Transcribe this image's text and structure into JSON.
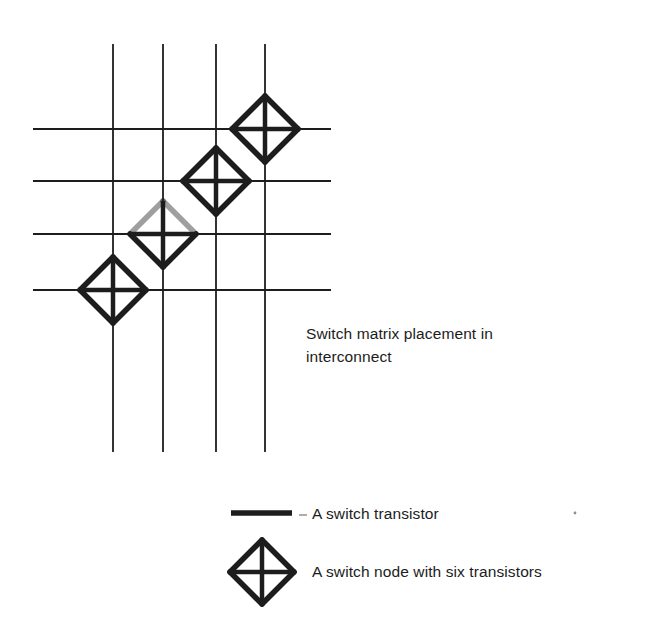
{
  "figure": {
    "kind": "schematic-diagram",
    "background_color": "#ffffff",
    "ink_color": "#1d1d1d",
    "grid": {
      "name": "interconnect-routing-grid",
      "vertical_lines": [
        {
          "x": 113,
          "y1": 44,
          "y2": 452
        },
        {
          "x": 163,
          "y1": 44,
          "y2": 452
        },
        {
          "x": 216,
          "y1": 44,
          "y2": 452
        },
        {
          "x": 265,
          "y1": 44,
          "y2": 452
        }
      ],
      "horizontal_lines": [
        {
          "y": 129,
          "x1": 33,
          "x2": 331
        },
        {
          "y": 181,
          "x1": 33,
          "x2": 331
        },
        {
          "y": 234,
          "x1": 33,
          "x2": 331
        },
        {
          "y": 290,
          "x1": 33,
          "x2": 331
        }
      ],
      "line_width": 1.8
    },
    "switch_nodes": [
      {
        "id": "switch-node-1",
        "cx": 265,
        "cy": 129,
        "r": 33,
        "faded_top": false
      },
      {
        "id": "switch-node-2",
        "cx": 216,
        "cy": 181,
        "r": 33,
        "faded_top": false
      },
      {
        "id": "switch-node-3",
        "cx": 163,
        "cy": 234,
        "r": 33,
        "faded_top": true
      },
      {
        "id": "switch-node-4",
        "cx": 113,
        "cy": 290,
        "r": 33,
        "faded_top": false
      }
    ],
    "node_stroke_width": 5.5,
    "node_cross_width": 4.5
  },
  "caption": {
    "line1": "Switch matrix placement in",
    "line2": "interconnect"
  },
  "legend": {
    "rows": [
      {
        "icon": "thick-line-icon",
        "label": "A switch transistor",
        "swatch": {
          "x1": 231,
          "x2": 292,
          "y": 513,
          "thickness": 5.5
        }
      },
      {
        "icon": "diamond-switch-node-icon",
        "label": "A switch node with six transistors",
        "glyph": {
          "cx": 262,
          "cy": 572,
          "r": 32
        }
      }
    ]
  },
  "artifacts": {
    "dash_mark": {
      "x1": 299,
      "x2": 307,
      "y": 515
    },
    "speck_right": {
      "cx": 575,
      "cy": 513,
      "r": 1.4
    }
  }
}
